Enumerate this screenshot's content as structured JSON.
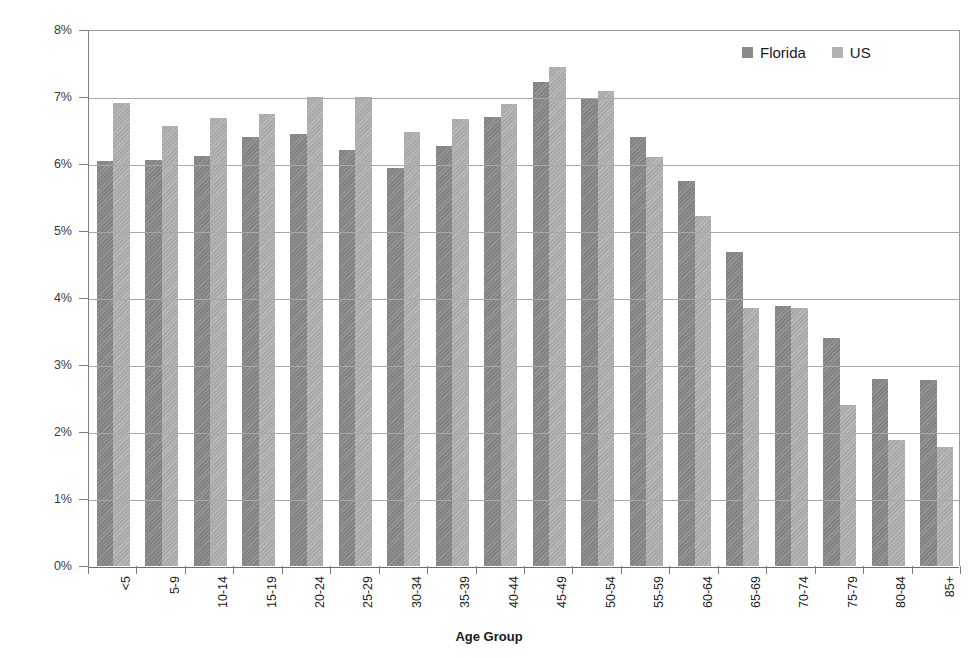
{
  "chart_data": {
    "type": "bar",
    "title": "",
    "xlabel": "Age Group",
    "ylabel": "Percent of Population",
    "ylim": [
      0,
      8
    ],
    "ytick_labels": [
      "0%",
      "1%",
      "2%",
      "3%",
      "4%",
      "5%",
      "6%",
      "7%",
      "8%"
    ],
    "ytick_values": [
      0,
      1,
      2,
      3,
      4,
      5,
      6,
      7,
      8
    ],
    "grid": true,
    "legend_position": "top-right",
    "categories": [
      "<5",
      "5-9",
      "10-14",
      "15-19",
      "20-24",
      "25-29",
      "30-34",
      "35-39",
      "40-44",
      "45-49",
      "50-54",
      "55-59",
      "60-64",
      "65-69",
      "70-74",
      "75-79",
      "80-84",
      "85+"
    ],
    "series": [
      {
        "name": "Florida",
        "color": "#8a8a8a",
        "values": [
          6.05,
          6.06,
          6.12,
          6.4,
          6.45,
          6.21,
          5.94,
          6.27,
          6.7,
          7.22,
          6.98,
          6.4,
          5.75,
          4.68,
          3.88,
          3.4,
          2.79,
          2.78
        ]
      },
      {
        "name": "US",
        "color": "#b2b2b2",
        "values": [
          6.91,
          6.57,
          6.69,
          6.75,
          7.0,
          7.0,
          6.48,
          6.67,
          6.9,
          7.45,
          7.09,
          6.1,
          5.22,
          3.85,
          3.85,
          2.4,
          1.88,
          1.78
        ]
      }
    ]
  },
  "legend": {
    "entries": [
      {
        "label": "Florida",
        "key": "fl"
      },
      {
        "label": "US",
        "key": "us"
      }
    ]
  }
}
